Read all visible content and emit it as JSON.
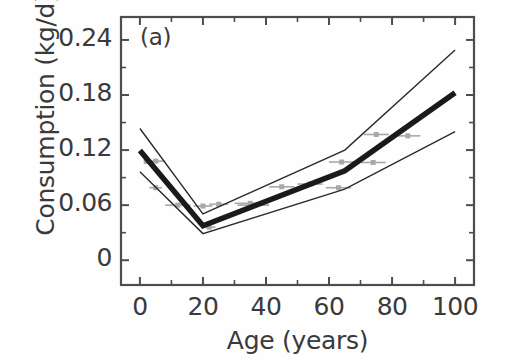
{
  "figure": {
    "panel_label": "(a)",
    "background_color": "#fefefe",
    "axis_color": "#4d4d4d",
    "text_color": "#3a3a3a"
  },
  "chart_data": {
    "type": "line",
    "title": "",
    "subtitle": "",
    "panel": "(a)",
    "xlabel": "Age (years)",
    "ylabel": "Consumption (kg/d)",
    "xlim": [
      -6,
      106
    ],
    "ylim": [
      -0.027,
      0.265
    ],
    "xticks": [
      0,
      20,
      40,
      60,
      80,
      100
    ],
    "xtick_labels": [
      "0",
      "20",
      "40",
      "60",
      "80",
      "100"
    ],
    "yticks": [
      0,
      0.06,
      0.12,
      0.18,
      0.24
    ],
    "ytick_labels": [
      "0",
      "0.06",
      "0.12",
      "0.18",
      "0.24"
    ],
    "grid": false,
    "legend": null,
    "legend_position": "none",
    "minor_xticks": [
      10,
      30,
      50,
      70,
      90
    ],
    "minor_yticks": [
      0.03,
      0.09,
      0.15,
      0.21
    ],
    "series": [
      {
        "name": "Mean consumption",
        "style": "thick-solid",
        "color": "#1a1a1a",
        "linewidth": 5.5,
        "x": [
          0,
          20,
          65,
          100
        ],
        "values": [
          0.1195,
          0.0375,
          0.0975,
          0.1825
        ]
      },
      {
        "name": "Upper confidence bound",
        "style": "thin-solid",
        "color": "#2b2b2b",
        "linewidth": 1.4,
        "x": [
          0,
          20,
          65,
          100
        ],
        "values": [
          0.1435,
          0.0505,
          0.12,
          0.229
        ]
      },
      {
        "name": "Lower confidence bound",
        "style": "thin-solid",
        "color": "#2b2b2b",
        "linewidth": 1.4,
        "x": [
          0,
          20,
          65,
          100
        ],
        "values": [
          0.0965,
          0.029,
          0.0775,
          0.14
        ]
      }
    ],
    "markers": {
      "name": "Observed data points",
      "style": "square",
      "color": "#a8a8a8",
      "size": 5,
      "errorbar_direction": "horizontal",
      "points": [
        {
          "x": 2,
          "y": 0.1075,
          "xerr_low": 0,
          "xerr_high": 4
        },
        {
          "x": 5,
          "y": 0.108,
          "xerr_low": 3,
          "xerr_high": 3
        },
        {
          "x": 5,
          "y": 0.079,
          "xerr_low": 2,
          "xerr_high": 2
        },
        {
          "x": 12,
          "y": 0.06,
          "xerr_low": 4,
          "xerr_high": 4
        },
        {
          "x": 20,
          "y": 0.059,
          "xerr_low": 3,
          "xerr_high": 3
        },
        {
          "x": 22,
          "y": 0.036,
          "xerr_low": 2,
          "xerr_high": 2
        },
        {
          "x": 25,
          "y": 0.061,
          "xerr_low": 3,
          "xerr_high": 3
        },
        {
          "x": 35,
          "y": 0.062,
          "xerr_low": 5,
          "xerr_high": 5
        },
        {
          "x": 36,
          "y": 0.06,
          "xerr_low": 5,
          "xerr_high": 5
        },
        {
          "x": 45,
          "y": 0.08,
          "xerr_low": 4,
          "xerr_high": 4
        },
        {
          "x": 54,
          "y": 0.083,
          "xerr_low": 4,
          "xerr_high": 4
        },
        {
          "x": 63,
          "y": 0.079,
          "xerr_low": 4,
          "xerr_high": 4
        },
        {
          "x": 64,
          "y": 0.107,
          "xerr_low": 4,
          "xerr_high": 4
        },
        {
          "x": 74,
          "y": 0.1065,
          "xerr_low": 4,
          "xerr_high": 4
        },
        {
          "x": 75,
          "y": 0.137,
          "xerr_low": 4,
          "xerr_high": 4
        },
        {
          "x": 85,
          "y": 0.1355,
          "xerr_low": 4,
          "xerr_high": 4
        }
      ]
    }
  }
}
